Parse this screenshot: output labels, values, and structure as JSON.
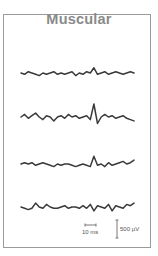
{
  "chart_data": {
    "type": "line",
    "title": "Muscular",
    "xlabel": "",
    "ylabel": "",
    "grid": false,
    "legend": null,
    "series": [
      {
        "name": "trace-1",
        "values": [
          0,
          -1,
          1,
          0,
          -1,
          -2,
          0,
          -1,
          0,
          1,
          -1,
          0,
          -1,
          0,
          1,
          -2,
          0,
          -1,
          1,
          0,
          4,
          -1,
          0,
          1,
          -1,
          0,
          1,
          0,
          -1,
          0,
          1,
          0
        ]
      },
      {
        "name": "trace-2",
        "values": [
          0,
          2,
          -1,
          1,
          3,
          0,
          -2,
          1,
          0,
          -3,
          0,
          1,
          -1,
          2,
          0,
          1,
          -1,
          0,
          1,
          -2,
          10,
          -5,
          0,
          2,
          0,
          1,
          -1,
          0,
          1,
          -1,
          -2,
          -3
        ]
      },
      {
        "name": "trace-3",
        "values": [
          0,
          1,
          0,
          1,
          -1,
          0,
          1,
          0,
          -1,
          -2,
          0,
          -1,
          0,
          0,
          -1,
          -2,
          -1,
          0,
          -1,
          -2,
          6,
          -1,
          0,
          -2,
          1,
          -1,
          0,
          1,
          2,
          0,
          1,
          3
        ]
      },
      {
        "name": "trace-4",
        "values": [
          0,
          -1,
          -2,
          -1,
          3,
          0,
          -1,
          2,
          0,
          -1,
          -1,
          0,
          1,
          -1,
          0,
          0,
          -1,
          1,
          -1,
          2,
          -3,
          1,
          0,
          -1,
          2,
          -3,
          1,
          0,
          -1,
          2,
          1,
          3
        ]
      }
    ],
    "scale_bars": {
      "time": "10 ms",
      "amplitude": "500 µV"
    }
  },
  "labels": {
    "title": "Muscular",
    "time_scale": "10 ms",
    "amp_scale": "500 µV"
  }
}
